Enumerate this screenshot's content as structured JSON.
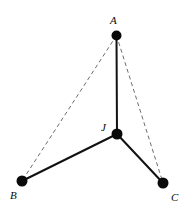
{
  "figure": {
    "kind": "geometry-diagram",
    "width": 190,
    "height": 210,
    "background_color": "#ffffff"
  },
  "style": {
    "solid_edge_color": "#111111",
    "dashed_edge_color": "#6e6e6e",
    "vertex_color": "#0a0a0a",
    "label_color": "#0a0a0a"
  },
  "vertices": [
    {
      "id": "A",
      "label": "A",
      "cx": 116.5,
      "cy": 35.5,
      "r": 5,
      "label_x": 110,
      "label_y": 24,
      "label_position": "above-left"
    },
    {
      "id": "J",
      "label": "J",
      "cx": 117,
      "cy": 134,
      "r": 5.5,
      "label_x": 101,
      "label_y": 131,
      "label_position": "left"
    },
    {
      "id": "B",
      "label": "B",
      "cx": 22,
      "cy": 181,
      "r": 5.5,
      "label_x": 10,
      "label_y": 199,
      "label_position": "below-left"
    },
    {
      "id": "C",
      "label": "C",
      "cx": 163,
      "cy": 183,
      "r": 5.5,
      "label_x": 171,
      "label_y": 201,
      "label_position": "below-right"
    }
  ],
  "edges": [
    {
      "id": "A-J",
      "from": "A",
      "to": "B",
      "label": "A to J",
      "style": "solid",
      "x1": 116.5,
      "y1": 35.5,
      "x2": 117,
      "y2": 134
    },
    {
      "id": "J-B",
      "from": "J",
      "to": "B",
      "label": "J to B",
      "style": "solid",
      "x1": 117,
      "y1": 134,
      "x2": 22,
      "y2": 181
    },
    {
      "id": "J-C",
      "from": "J",
      "to": "C",
      "label": "J to C",
      "style": "solid",
      "x1": 117,
      "y1": 134,
      "x2": 163,
      "y2": 183
    },
    {
      "id": "A-B",
      "from": "A",
      "to": "B",
      "label": "A to B",
      "style": "dashed",
      "x1": 116.5,
      "y1": 35.5,
      "x2": 22,
      "y2": 181
    },
    {
      "id": "A-C",
      "from": "A",
      "to": "C",
      "label": "A to C",
      "style": "dashed",
      "x1": 116.5,
      "y1": 35.5,
      "x2": 163,
      "y2": 183
    }
  ]
}
